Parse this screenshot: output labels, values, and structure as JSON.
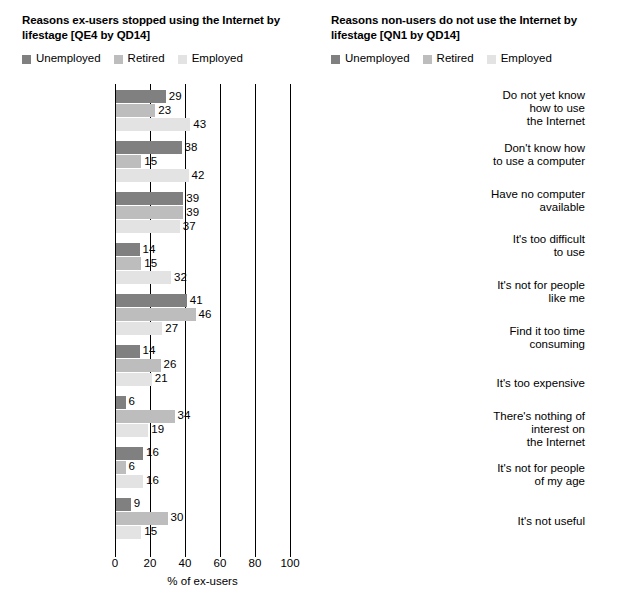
{
  "legend": {
    "items": [
      {
        "label": "Unemployed",
        "color": "#808080"
      },
      {
        "label": "Retired",
        "color": "#bdbdbd"
      },
      {
        "label": "Employed",
        "color": "#e3e3e3"
      }
    ]
  },
  "axis": {
    "ticks": [
      "0",
      "20",
      "40",
      "60",
      "80",
      "100"
    ]
  },
  "chart_data": [
    {
      "type": "bar",
      "orientation": "horizontal",
      "title": "Reasons ex-users stopped using the Internet by lifestage [QE4 by QD14]",
      "xlabel": "% of ex-users",
      "ylabel": "",
      "xlim": [
        0,
        100
      ],
      "xticks": [
        0,
        20,
        40,
        60,
        80,
        100
      ],
      "grid": true,
      "legend_position": "top-left",
      "categories": [
        "No longer have a\ncomputer available",
        "Moved house/job",
        "Just not interested",
        "I do not have\nenough time",
        "Too expensive",
        "Worried about\nyour privacy",
        "Had bad\nexperiences with\nSPAM or viruses",
        "Because I was\nspending too much\ntime on it",
        "It was too difficult\nto use"
      ],
      "series": [
        {
          "name": "Unemployed",
          "color": "#808080",
          "values": [
            29,
            38,
            39,
            14,
            41,
            14,
            6,
            16,
            9
          ]
        },
        {
          "name": "Retired",
          "color": "#bdbdbd",
          "values": [
            23,
            15,
            39,
            15,
            46,
            26,
            34,
            6,
            30
          ]
        },
        {
          "name": "Employed",
          "color": "#e3e3e3",
          "values": [
            43,
            42,
            37,
            32,
            27,
            21,
            19,
            16,
            15
          ]
        }
      ]
    },
    {
      "type": "bar",
      "orientation": "horizontal",
      "title": "Reasons non-users do not use the Internet by lifestage [QN1 by QD14]",
      "xlabel": "% of non-users",
      "ylabel": "",
      "xlim": [
        0,
        100
      ],
      "xticks": [
        0,
        20,
        40,
        60,
        80,
        100
      ],
      "grid": true,
      "legend_position": "top-left",
      "categories": [
        "Do not yet know\nhow to use\nthe Internet",
        "Don't know how\nto use a computer",
        "Have no computer\navailable",
        "It's too difficult\nto use",
        "It's not for people\nlike me",
        "Find it too time\nconsuming",
        "It's too expensive",
        "There's nothing of\ninterest on\nthe Internet",
        "It's not for people\nof my age",
        "It's not useful"
      ],
      "series": [
        {
          "name": "Unemployed",
          "color": "#808080",
          "values": [
            83,
            79,
            74,
            67,
            50,
            44,
            67,
            42,
            30,
            34
          ]
        },
        {
          "name": "Retired",
          "color": "#bdbdbd",
          "values": [
            81,
            80,
            77,
            65,
            65,
            35,
            50,
            61,
            62,
            44
          ]
        },
        {
          "name": "Employed",
          "color": "#e3e3e3",
          "values": [
            79,
            70,
            68,
            59,
            56,
            47,
            44,
            43,
            31,
            30
          ]
        }
      ]
    }
  ]
}
